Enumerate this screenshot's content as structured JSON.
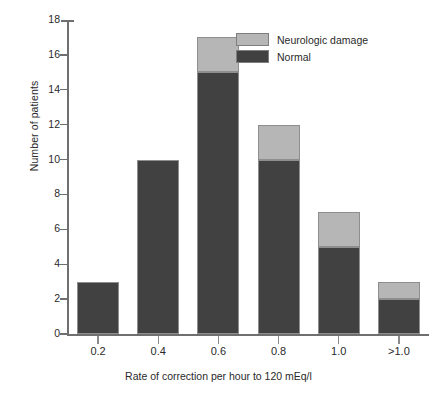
{
  "chart_data": {
    "type": "bar",
    "subtype": "stacked-bar",
    "title": "",
    "xlabel": "Rate of correction per hour to 120 mEq/l",
    "ylabel": "Number of patients",
    "categories": [
      "0.2",
      "0.4",
      "0.6",
      "0.8",
      "1.0",
      ">1.0"
    ],
    "series": [
      {
        "name": "Normal",
        "color": "#414141",
        "values": [
          3,
          10,
          15,
          10,
          5,
          2
        ]
      },
      {
        "name": "Neurologic damage",
        "color": "#b6b6b6",
        "values": [
          0,
          0,
          2,
          2,
          2,
          1
        ]
      }
    ],
    "totals": [
      3,
      10,
      17,
      12,
      7,
      3
    ],
    "ylim": [
      0,
      18
    ],
    "yticks": [
      0,
      2,
      4,
      6,
      8,
      10,
      12,
      14,
      16,
      18
    ],
    "ytick_labels": [
      "0",
      "2",
      "4",
      "6",
      "8",
      "10",
      "12",
      "14",
      "16",
      "18"
    ],
    "grid": false,
    "legend_position": "top-right",
    "legend_order": [
      "Neurologic damage",
      "Normal"
    ]
  },
  "legend": {
    "entries": [
      {
        "label": "Neurologic damage",
        "color": "#b6b6b6"
      },
      {
        "label": "Normal",
        "color": "#414141"
      }
    ]
  },
  "colors": {
    "normal": "#414141",
    "neurologic_damage": "#b6b6b6",
    "axis": "#6f6f6f",
    "text": "#2a2a2a",
    "background": "#ffffff",
    "bar_outline": "#8e8e8e"
  }
}
